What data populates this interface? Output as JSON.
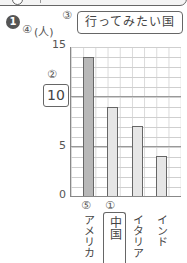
{
  "problem_number": "1",
  "markers": {
    "title_marker": "③",
    "unit_marker": "④",
    "answer_marker": "②",
    "first_bar_marker": "⑤",
    "second_bar_marker": "①"
  },
  "chart_data": {
    "type": "bar",
    "title": "行ってみたい国",
    "ylabel": "(人)",
    "xlabel": "",
    "categories": [
      "アメリカ",
      "中国",
      "イタリア",
      "インド"
    ],
    "values": [
      14,
      9,
      7,
      4
    ],
    "ylim": [
      0,
      15
    ],
    "yticks": [
      "15",
      "10",
      "5",
      "0"
    ],
    "grid": true,
    "legend": null,
    "highlighted_category": "中国",
    "bar_colors": [
      "#b8b8b8",
      "#e6e6e6",
      "#e6e6e6",
      "#e6e6e6"
    ]
  },
  "labels": {
    "y_top": "15",
    "y_mid_answer": "10",
    "y_5": "5",
    "y_0": "0"
  }
}
